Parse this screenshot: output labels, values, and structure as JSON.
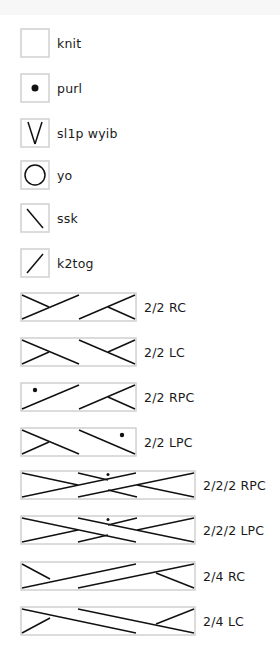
{
  "legend": {
    "items": [
      {
        "key": "knit",
        "label": "knit",
        "symbol": "blank",
        "width_sts": 1
      },
      {
        "key": "purl",
        "label": "purl",
        "symbol": "dot",
        "width_sts": 1
      },
      {
        "key": "sl1p-wyib",
        "label": "sl1p wyib",
        "symbol": "v",
        "width_sts": 1
      },
      {
        "key": "yo",
        "label": "yo",
        "symbol": "circle",
        "width_sts": 1
      },
      {
        "key": "ssk",
        "label": "ssk",
        "symbol": "backslash",
        "width_sts": 1
      },
      {
        "key": "k2tog",
        "label": "k2tog",
        "symbol": "slash",
        "width_sts": 1
      },
      {
        "key": "2-2-rc",
        "label": "2/2 RC",
        "symbol": "cable-right",
        "width_sts": 4
      },
      {
        "key": "2-2-lc",
        "label": "2/2 LC",
        "symbol": "cable-left",
        "width_sts": 4
      },
      {
        "key": "2-2-rpc",
        "label": "2/2 RPC",
        "symbol": "cable-right-purl",
        "width_sts": 4
      },
      {
        "key": "2-2-lpc",
        "label": "2/2 LPC",
        "symbol": "cable-left-purl",
        "width_sts": 4
      },
      {
        "key": "2-2-2-rpc",
        "label": "2/2/2 RPC",
        "symbol": "cable-3way-right-purl",
        "width_sts": 6
      },
      {
        "key": "2-2-2-lpc",
        "label": "2/2/2 LPC",
        "symbol": "cable-3way-left-purl",
        "width_sts": 6
      },
      {
        "key": "2-4-rc",
        "label": "2/4 RC",
        "symbol": "cable-2-4-right",
        "width_sts": 6
      },
      {
        "key": "2-4-lc",
        "label": "2/4 LC",
        "symbol": "cable-2-4-left",
        "width_sts": 6
      }
    ]
  },
  "colors": {
    "box_border": "#d0d0d0",
    "stroke": "#111111",
    "text": "#1a1a1a",
    "top_band": "#f7f7f7"
  }
}
